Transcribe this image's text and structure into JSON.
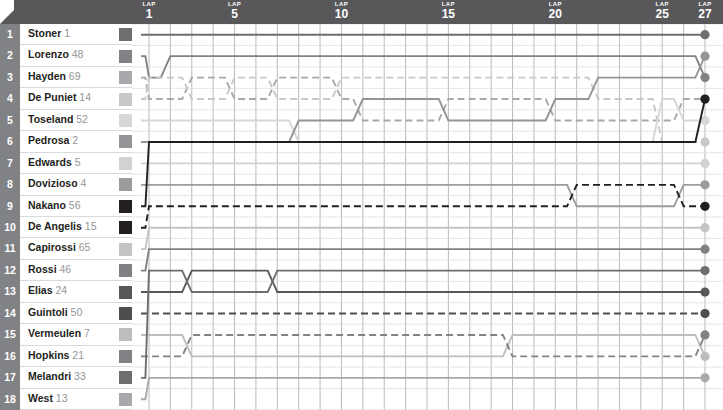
{
  "header": {
    "lap_word": "LAP",
    "lap_marks": [
      {
        "label": "1",
        "lap": 1
      },
      {
        "label": "5",
        "lap": 5
      },
      {
        "label": "10",
        "lap": 10
      },
      {
        "label": "15",
        "lap": 15
      },
      {
        "label": "20",
        "lap": 20
      },
      {
        "label": "25",
        "lap": 25
      },
      {
        "label": "27",
        "lap": 27
      }
    ]
  },
  "positions": [
    "1",
    "2",
    "3",
    "4",
    "5",
    "6",
    "7",
    "8",
    "9",
    "10",
    "11",
    "12",
    "13",
    "14",
    "15",
    "16",
    "17",
    "18"
  ],
  "riders": [
    {
      "grid": 1,
      "name": "Stoner",
      "number": "1",
      "color": "#6d6e70",
      "dash": false
    },
    {
      "grid": 2,
      "name": "Lorenzo",
      "number": "48",
      "color": "#808285",
      "dash": false
    },
    {
      "grid": 3,
      "name": "Hayden",
      "number": "69",
      "color": "#a7a9ac",
      "dash": true
    },
    {
      "grid": 4,
      "name": "De Puniet",
      "number": "14",
      "color": "#c7c8ca",
      "dash": true
    },
    {
      "grid": 5,
      "name": "Toseland",
      "number": "52",
      "color": "#d6d7d8",
      "dash": false
    },
    {
      "grid": 6,
      "name": "Pedrosa",
      "number": "2",
      "color": "#939598",
      "dash": false
    },
    {
      "grid": 7,
      "name": "Edwards",
      "number": "5",
      "color": "#d0d2d3",
      "dash": false
    },
    {
      "grid": 8,
      "name": "Dovizioso",
      "number": "4",
      "color": "#9a9c9e",
      "dash": false
    },
    {
      "grid": 9,
      "name": "Nakano",
      "number": "56",
      "color": "#231f20",
      "dash": false
    },
    {
      "grid": 10,
      "name": "De Angelis",
      "number": "15",
      "color": "#231f20",
      "dash": true
    },
    {
      "grid": 11,
      "name": "Capirossi",
      "number": "65",
      "color": "#c2c4c6",
      "dash": false
    },
    {
      "grid": 12,
      "name": "Rossi",
      "number": "46",
      "color": "#7f8184",
      "dash": false
    },
    {
      "grid": 13,
      "name": "Elias",
      "number": "24",
      "color": "#58585a",
      "dash": false
    },
    {
      "grid": 14,
      "name": "Guintoli",
      "number": "50",
      "color": "#4d4e50",
      "dash": true
    },
    {
      "grid": 15,
      "name": "Vermeulen",
      "number": "7",
      "color": "#bcbec0",
      "dash": false
    },
    {
      "grid": 16,
      "name": "Hopkins",
      "number": "21",
      "color": "#808285",
      "dash": true
    },
    {
      "grid": 17,
      "name": "Melandri",
      "number": "33",
      "color": "#6d6e70",
      "dash": false
    },
    {
      "grid": 18,
      "name": "West",
      "number": "13",
      "color": "#a7a9ac",
      "dash": false
    }
  ],
  "chart_data": {
    "type": "line",
    "title": "",
    "xlabel": "LAP",
    "ylabel": "Position",
    "x": [
      0,
      1,
      2,
      3,
      4,
      5,
      6,
      7,
      8,
      9,
      10,
      11,
      12,
      13,
      14,
      15,
      16,
      17,
      18,
      19,
      20,
      21,
      22,
      23,
      24,
      25,
      26,
      27
    ],
    "xlim": [
      0,
      27
    ],
    "ylim": [
      1,
      18
    ],
    "y_inverted": true,
    "grid": true,
    "legend": "row-labels-left",
    "x_tick_labels": [
      "1",
      "5",
      "10",
      "15",
      "20",
      "25",
      "27"
    ],
    "x_tick_values": [
      1,
      5,
      10,
      15,
      20,
      25,
      27
    ],
    "series": [
      {
        "name": "Stoner",
        "number": "1",
        "color": "#6d6e70",
        "dash": false,
        "values": [
          1,
          1,
          1,
          1,
          1,
          1,
          1,
          1,
          1,
          1,
          1,
          1,
          1,
          1,
          1,
          1,
          1,
          1,
          1,
          1,
          1,
          1,
          1,
          1,
          1,
          1,
          1,
          1
        ]
      },
      {
        "name": "Lorenzo",
        "number": "48",
        "color": "#808285",
        "dash": false,
        "values": [
          2,
          3,
          2,
          2,
          2,
          2,
          2,
          2,
          2,
          2,
          2,
          2,
          2,
          2,
          2,
          2,
          2,
          2,
          2,
          2,
          2,
          2,
          2,
          2,
          2,
          2,
          2,
          3
        ]
      },
      {
        "name": "Hayden",
        "number": "69",
        "color": "#a7a9ac",
        "dash": true,
        "values": [
          3,
          4,
          4,
          3,
          3,
          4,
          4,
          3,
          3,
          3,
          4,
          5,
          5,
          5,
          5,
          4,
          4,
          4,
          4,
          4,
          5,
          5,
          5,
          5,
          5,
          5,
          4,
          4
        ]
      },
      {
        "name": "De Puniet",
        "number": "14",
        "color": "#c7c8ca",
        "dash": true,
        "values": [
          4,
          3,
          3,
          4,
          4,
          3,
          3,
          4,
          4,
          4,
          3,
          3,
          3,
          3,
          3,
          3,
          3,
          3,
          3,
          3,
          3,
          3,
          4,
          4,
          4,
          6,
          6,
          6
        ]
      },
      {
        "name": "Toseland",
        "number": "52",
        "color": "#d6d7d8",
        "dash": false,
        "values": [
          5,
          5,
          5,
          5,
          5,
          5,
          5,
          5,
          6,
          6,
          6,
          6,
          6,
          6,
          6,
          6,
          6,
          6,
          6,
          6,
          6,
          6,
          6,
          6,
          6,
          4,
          5,
          5
        ]
      },
      {
        "name": "Pedrosa",
        "number": "2",
        "color": "#939598",
        "dash": false,
        "values": [
          6,
          6,
          6,
          6,
          6,
          6,
          6,
          6,
          5,
          5,
          5,
          4,
          4,
          4,
          4,
          5,
          5,
          5,
          5,
          5,
          4,
          4,
          3,
          3,
          3,
          3,
          3,
          2
        ]
      },
      {
        "name": "Edwards",
        "number": "5",
        "color": "#d0d2d3",
        "dash": false,
        "values": [
          7,
          7,
          7,
          7,
          7,
          7,
          7,
          7,
          7,
          7,
          7,
          7,
          7,
          7,
          7,
          7,
          7,
          7,
          7,
          7,
          7,
          7,
          7,
          7,
          7,
          7,
          7,
          7
        ]
      },
      {
        "name": "Dovizioso",
        "number": "4",
        "color": "#9a9c9e",
        "dash": false,
        "values": [
          8,
          8,
          8,
          8,
          8,
          8,
          8,
          8,
          8,
          8,
          8,
          8,
          8,
          8,
          8,
          8,
          8,
          8,
          8,
          8,
          8,
          9,
          9,
          9,
          9,
          9,
          8,
          8
        ]
      },
      {
        "name": "Nakano",
        "number": "56",
        "color": "#231f20",
        "dash": false,
        "values": [
          9,
          6,
          6,
          6,
          6,
          6,
          6,
          6,
          6,
          6,
          6,
          6,
          6,
          6,
          6,
          6,
          6,
          6,
          6,
          6,
          6,
          6,
          6,
          6,
          6,
          6,
          6,
          4
        ]
      },
      {
        "name": "De Angelis",
        "number": "15",
        "color": "#231f20",
        "dash": true,
        "values": [
          10,
          9,
          9,
          9,
          9,
          9,
          9,
          9,
          9,
          9,
          9,
          9,
          9,
          9,
          9,
          9,
          9,
          9,
          9,
          9,
          9,
          8,
          8,
          8,
          8,
          8,
          9,
          9
        ]
      },
      {
        "name": "Capirossi",
        "number": "65",
        "color": "#c2c4c6",
        "dash": false,
        "values": [
          11,
          10,
          10,
          10,
          10,
          10,
          10,
          10,
          10,
          10,
          10,
          10,
          10,
          10,
          10,
          10,
          10,
          10,
          10,
          10,
          10,
          10,
          10,
          10,
          10,
          10,
          10,
          10
        ]
      },
      {
        "name": "Rossi",
        "number": "46",
        "color": "#7f8184",
        "dash": false,
        "values": [
          12,
          11,
          11,
          11,
          11,
          11,
          11,
          11,
          11,
          11,
          11,
          11,
          11,
          11,
          11,
          11,
          11,
          11,
          11,
          11,
          11,
          11,
          11,
          11,
          11,
          11,
          11,
          11
        ]
      },
      {
        "name": "Elias",
        "number": "24",
        "color": "#58585a",
        "dash": false,
        "values": [
          13,
          13,
          13,
          12,
          12,
          12,
          12,
          13,
          13,
          13,
          13,
          13,
          13,
          13,
          13,
          13,
          13,
          13,
          13,
          13,
          13,
          13,
          13,
          13,
          13,
          13,
          13,
          13
        ]
      },
      {
        "name": "Guintoli",
        "number": "50",
        "color": "#4d4e50",
        "dash": true,
        "values": [
          14,
          14,
          14,
          14,
          14,
          14,
          14,
          14,
          14,
          14,
          14,
          14,
          14,
          14,
          14,
          14,
          14,
          14,
          14,
          14,
          14,
          14,
          14,
          14,
          14,
          14,
          14,
          14
        ]
      },
      {
        "name": "Vermeulen",
        "number": "7",
        "color": "#bcbec0",
        "dash": false,
        "values": [
          15,
          15,
          15,
          16,
          16,
          16,
          16,
          16,
          16,
          16,
          16,
          16,
          16,
          16,
          16,
          16,
          16,
          16,
          15,
          15,
          15,
          15,
          15,
          15,
          15,
          15,
          15,
          16
        ]
      },
      {
        "name": "Hopkins",
        "number": "21",
        "color": "#808285",
        "dash": true,
        "values": [
          16,
          16,
          16,
          15,
          15,
          15,
          15,
          15,
          15,
          15,
          15,
          15,
          15,
          15,
          15,
          15,
          15,
          15,
          16,
          16,
          16,
          16,
          16,
          16,
          16,
          16,
          16,
          15
        ]
      },
      {
        "name": "Melandri",
        "number": "33",
        "color": "#6d6e70",
        "dash": false,
        "values": [
          17,
          12,
          12,
          13,
          13,
          13,
          13,
          12,
          12,
          12,
          12,
          12,
          12,
          12,
          12,
          12,
          12,
          12,
          12,
          12,
          12,
          12,
          12,
          12,
          12,
          12,
          12,
          12
        ]
      },
      {
        "name": "West",
        "number": "13",
        "color": "#a7a9ac",
        "dash": false,
        "values": [
          18,
          17,
          17,
          17,
          17,
          17,
          17,
          17,
          17,
          17,
          17,
          17,
          17,
          17,
          17,
          17,
          17,
          17,
          17,
          17,
          17,
          17,
          17,
          17,
          17,
          17,
          17,
          17
        ]
      }
    ]
  }
}
